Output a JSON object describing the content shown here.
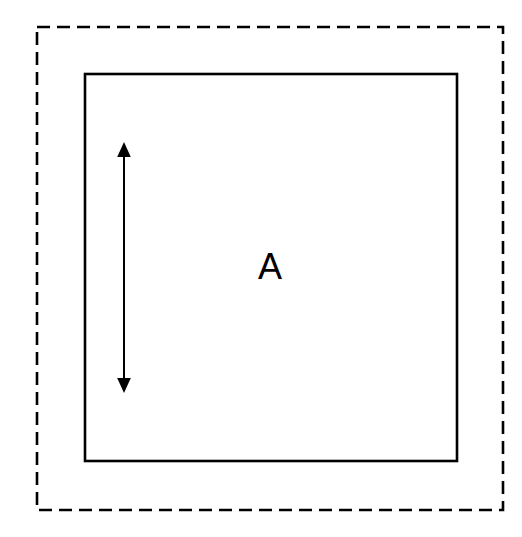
{
  "figure": {
    "canvas": {
      "width": 522,
      "height": 537,
      "background_color": "#ffffff"
    },
    "stroke_color": "#000000",
    "elements": {
      "outer_boundary": {
        "name": "outer-dashed-rectangle",
        "style": "dashed",
        "x": 37,
        "y": 27,
        "width": 466,
        "height": 483,
        "stroke_width": 2.6,
        "dash_length": 13,
        "dash_gap": 7,
        "color": "#000000"
      },
      "inner_region": {
        "name": "inner-solid-rectangle",
        "style": "solid",
        "x": 85,
        "y": 74,
        "width": 372,
        "height": 387,
        "stroke_width": 2.6,
        "color": "#000000",
        "fill": "none"
      },
      "dimension_arrow": {
        "name": "vertical-double-headed-arrow",
        "orientation": "vertical",
        "x": 124,
        "y_top": 142,
        "y_bottom": 393,
        "length": 251,
        "line_width": 2,
        "arrowhead_width": 13,
        "arrowhead_height": 14,
        "heads": "both",
        "color": "#000000"
      },
      "region_label": {
        "name": "region-label-a",
        "text": "A",
        "x": 270,
        "y": 279,
        "font_size": 36,
        "color": "#000000"
      }
    }
  }
}
